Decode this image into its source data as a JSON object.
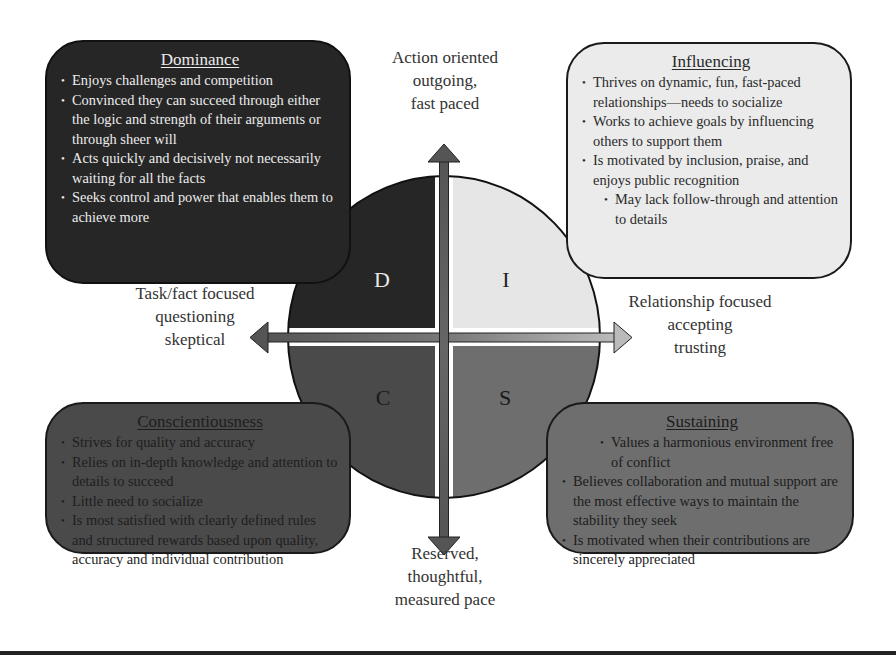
{
  "axes": {
    "top": [
      "Action oriented",
      "outgoing,",
      "fast paced"
    ],
    "bottom": [
      "Reserved,",
      "thoughtful,",
      "measured pace"
    ],
    "left": [
      "Task/fact focused",
      "questioning",
      "skeptical"
    ],
    "right": [
      "Relationship focused",
      "accepting",
      "trusting"
    ]
  },
  "quadrants": {
    "d": {
      "letter": "D",
      "color": "#262626"
    },
    "i": {
      "letter": "I",
      "color": "#e6e6e6"
    },
    "c": {
      "letter": "C",
      "color": "#4a4a4a"
    },
    "s": {
      "letter": "S",
      "color": "#6e6e6e"
    }
  },
  "boxes": {
    "dominance": {
      "title": "Dominance",
      "items": [
        "Enjoys challenges and competition",
        "Convinced they can succeed through either the logic and strength of their arguments or through sheer will",
        "Acts quickly and decisively not necessarily waiting for all the facts",
        "Seeks control and power that enables them to achieve more"
      ]
    },
    "influencing": {
      "title": "Influencing",
      "items": [
        "Thrives on dynamic, fun, fast-paced relationships—needs to socialize",
        "Works to achieve goals by influencing others to support them",
        "Is motivated by inclusion, praise, and enjoys public recognition",
        "May lack follow-through and attention to details"
      ]
    },
    "conscientiousness": {
      "title": "Conscientiousness",
      "items": [
        "Strives for quality and accuracy",
        "Relies on in-depth knowledge and attention to details to succeed",
        "Little need to socialize",
        "Is most satisfied with clearly defined rules and structured rewards based upon quality, accuracy and individual contribution"
      ]
    },
    "sustaining": {
      "title": "Sustaining",
      "items": [
        "Values a harmonious environment free of conflict",
        "Believes collaboration and mutual support are the most effective ways to maintain the stability they seek",
        "Is motivated when their contributions are sincerely appreciated"
      ]
    }
  }
}
